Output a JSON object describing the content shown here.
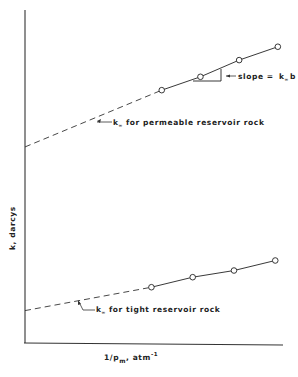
{
  "chart_data": {
    "type": "line",
    "title": "",
    "xlabel": "1/p_m, atm^-1",
    "xlabel_parts": {
      "main": "1/p",
      "sub": "m",
      "tail": ", atm",
      "sup": "-1"
    },
    "ylabel": "k, darcys",
    "xlim": [
      0,
      1
    ],
    "ylim": [
      0,
      1
    ],
    "grid": false,
    "ticks": "none",
    "series": [
      {
        "name": "permeable reservoir rock",
        "style": "solid with circular markers, dashed extrapolation to y-axis",
        "x": [
          0.53,
          0.68,
          0.83,
          0.98
        ],
        "y": [
          0.76,
          0.8,
          0.85,
          0.89
        ],
        "intercept": 0.59,
        "annotation": {
          "k": "k",
          "sub": "∞",
          "text": "for permeable reservoir rock"
        }
      },
      {
        "name": "tight reservoir rock",
        "style": "solid with circular markers, dashed extrapolation to y-axis",
        "x": [
          0.49,
          0.65,
          0.81,
          0.97
        ],
        "y": [
          0.17,
          0.2,
          0.22,
          0.25
        ],
        "intercept": 0.1,
        "annotation": {
          "k": "k",
          "sub": "∞",
          "text": "for tight reservoir rock"
        }
      }
    ],
    "slope_annotation": {
      "prefix": "slope = ",
      "k": "k",
      "sub": "∞",
      "suffix": "b",
      "series": "permeable reservoir rock"
    }
  }
}
